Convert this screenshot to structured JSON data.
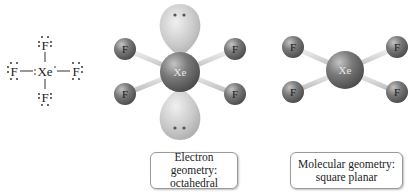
{
  "lewis_structure": {
    "central_atom": "Xe",
    "ligands": [
      "F",
      "F",
      "F",
      "F"
    ],
    "bond_symbol": "—"
  },
  "electron_geometry_model": {
    "central_atom": "Xe",
    "ligands": [
      "F",
      "F",
      "F",
      "F"
    ],
    "lone_pairs": 2,
    "caption_line1": "Electron geometry:",
    "caption_line2": "octahedral"
  },
  "molecular_geometry_model": {
    "central_atom": "Xe",
    "ligands": [
      "F",
      "F",
      "F",
      "F"
    ],
    "caption_line1": "Molecular geometry:",
    "caption_line2": "square planar"
  },
  "colors": {
    "atom": "#707070",
    "lobe": "#c8c8c8",
    "bond": "#e0e0e0",
    "text": "#222222"
  }
}
